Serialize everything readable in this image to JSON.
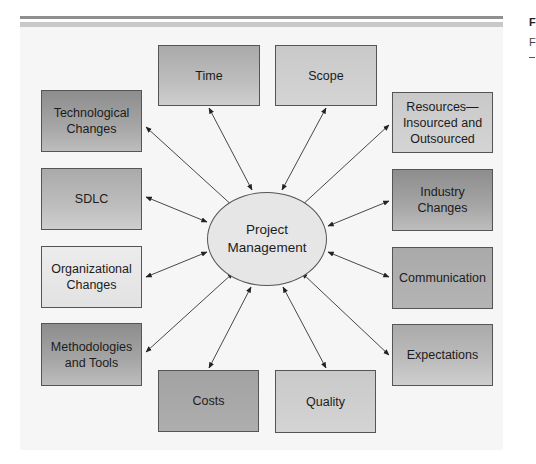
{
  "figure": {
    "side_caption_title_fragment": "F",
    "side_caption_text_fragment": "F"
  },
  "center": {
    "label": "Project\nManagement"
  },
  "nodes": {
    "time": {
      "label": "Time"
    },
    "scope": {
      "label": "Scope"
    },
    "technological_changes": {
      "label": "Technological\nChanges"
    },
    "sdlc": {
      "label": "SDLC"
    },
    "organizational_changes": {
      "label": "Organizational\nChanges"
    },
    "methodologies_tools": {
      "label": "Methodologies\nand Tools"
    },
    "costs": {
      "label": "Costs"
    },
    "quality": {
      "label": "Quality"
    },
    "resources": {
      "label": "Resources—\nInsourced and\nOutsourced"
    },
    "industry_changes": {
      "label": "Industry\nChanges"
    },
    "communication": {
      "label": "Communication"
    },
    "expectations": {
      "label": "Expectations"
    }
  },
  "edges": [
    {
      "from": "technological_changes",
      "to": "center",
      "type": "bidirectional"
    },
    {
      "from": "time",
      "to": "center",
      "type": "bidirectional"
    },
    {
      "from": "scope",
      "to": "center",
      "type": "bidirectional"
    },
    {
      "from": "resources",
      "to": "center",
      "type": "bidirectional"
    },
    {
      "from": "sdlc",
      "to": "center",
      "type": "bidirectional"
    },
    {
      "from": "industry_changes",
      "to": "center",
      "type": "bidirectional"
    },
    {
      "from": "organizational_changes",
      "to": "center",
      "type": "bidirectional"
    },
    {
      "from": "communication",
      "to": "center",
      "type": "bidirectional"
    },
    {
      "from": "methodologies_tools",
      "to": "center",
      "type": "bidirectional"
    },
    {
      "from": "expectations",
      "to": "center",
      "type": "bidirectional"
    },
    {
      "from": "costs",
      "to": "center",
      "type": "bidirectional"
    },
    {
      "from": "quality",
      "to": "center",
      "type": "bidirectional"
    }
  ],
  "colors": {
    "panel_background": "#f6f6f6",
    "border": "#555555",
    "arrow": "#333333"
  }
}
